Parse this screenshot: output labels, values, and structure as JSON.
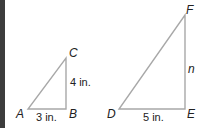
{
  "diagram": {
    "colors": {
      "edge_bar": "#3c3c3c",
      "lines": "#a8a8a8",
      "text": "#222222"
    },
    "triangles": [
      {
        "name": "ABC",
        "vertices": {
          "A": {
            "label": "A",
            "x": 28,
            "y": 109
          },
          "B": {
            "label": "B",
            "x": 66,
            "y": 109
          },
          "C": {
            "label": "C",
            "x": 66,
            "y": 58
          }
        },
        "sides": {
          "AB": "3 in.",
          "BC": "4 in."
        }
      },
      {
        "name": "DEF",
        "vertices": {
          "D": {
            "label": "D",
            "x": 119,
            "y": 109
          },
          "E": {
            "label": "E",
            "x": 185,
            "y": 109
          },
          "F": {
            "label": "F",
            "x": 185,
            "y": 15
          }
        },
        "sides": {
          "DE": "5 in.",
          "EF": "n"
        }
      }
    ]
  }
}
